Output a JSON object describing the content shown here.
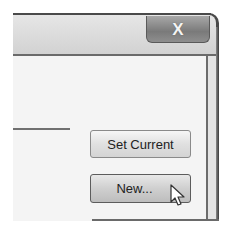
{
  "window": {
    "close_button": {
      "glyph": "X",
      "icon": "close-icon"
    }
  },
  "buttons": {
    "set_current_label": "Set Current",
    "new_label": "New..."
  },
  "cursor": {
    "icon": "mouse-pointer-icon",
    "hovering": "new-button"
  }
}
